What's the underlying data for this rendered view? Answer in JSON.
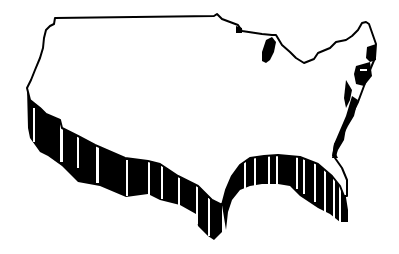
{
  "figure": {
    "subject": "Continental United States 3D extruded outline map",
    "style": "black and white clip art",
    "colors": {
      "background": "#ffffff",
      "surface": "#ffffff",
      "outline": "#000000",
      "extrusion": "#000000",
      "extrusion_gap": "#ffffff"
    },
    "features": {
      "great_lake_label": "Lake Michigan",
      "east_coast_label": "Atlantic coastline",
      "gulf_label": "Gulf coast",
      "west_label": "Pacific coastline"
    }
  }
}
